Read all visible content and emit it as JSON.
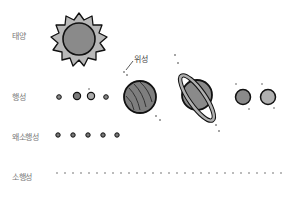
{
  "diagram": {
    "rows": [
      {
        "id": "sun",
        "label": "태양"
      },
      {
        "id": "planets",
        "label": "행성"
      },
      {
        "id": "dwarf-planets",
        "label": "왜소행성"
      },
      {
        "id": "asteroids",
        "label": "소행성"
      }
    ],
    "annotations": {
      "satellite": "위성"
    },
    "colors": {
      "fill_dark": "#7a7a7a",
      "fill_mid": "#9a9a9a",
      "fill_light": "#b8b8b8",
      "outline": "#111111",
      "label": "#777777"
    }
  }
}
